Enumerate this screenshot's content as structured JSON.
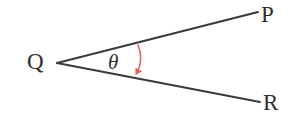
{
  "figure": {
    "type": "geometry-angle-diagram",
    "background_color": "#ffffff",
    "width": 298,
    "height": 123,
    "ray_color": "#3a3a3a",
    "ray_width": 2,
    "arc_color": "#e06464",
    "arc_width": 1.6,
    "label_color": "#2e2e2e"
  },
  "labels": {
    "vertex": "Q",
    "ray_upper_end": "P",
    "ray_lower_end": "R",
    "angle": "θ"
  },
  "geometry": {
    "vertex": {
      "x": 57,
      "y": 63
    },
    "ray_upper_end": {
      "x": 258,
      "y": 12
    },
    "ray_lower_end": {
      "x": 260,
      "y": 102
    },
    "arc_start": {
      "x": 138,
      "y": 45
    },
    "arc_end": {
      "x": 137,
      "y": 74
    },
    "arc_bulge_x": 144
  }
}
